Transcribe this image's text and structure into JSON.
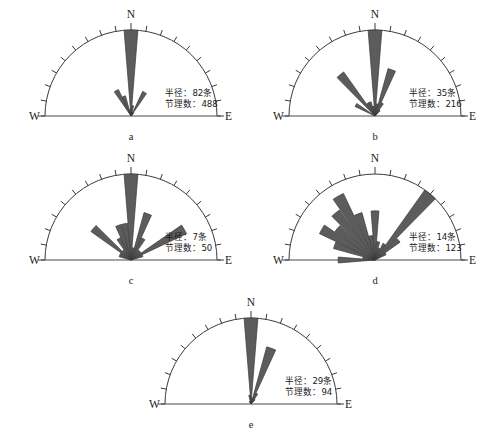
{
  "figure": {
    "type": "rose-diagram-set",
    "background": "#ffffff",
    "petal_fill": "#5c5c5c",
    "petal_stroke": "#3a3a3a",
    "axis_color": "#4a4a4a",
    "labels": {
      "north": "N",
      "west": "W",
      "east": "E",
      "radius_prefix": "半径：",
      "radius_suffix": "条",
      "count_prefix": "节理数：",
      "tick_interval_deg": 10
    }
  },
  "chart_data": {
    "type": "rose",
    "title": "",
    "xlabel": "",
    "ylabel": "",
    "angle_range_deg": [
      -90,
      90
    ],
    "angle_bin_deg": 10,
    "grid": false,
    "legend": null,
    "panels": [
      {
        "id": "a",
        "letter": "a",
        "radius_label": "半径：82条",
        "count_label": "节理数：488",
        "radius_value": 82,
        "count_value": 488,
        "north_label": "N",
        "west_label": "W",
        "east_label": "E",
        "bins_deg": [
          -90,
          -80,
          -70,
          -60,
          -50,
          -40,
          -30,
          -20,
          -10,
          0,
          10,
          20,
          30,
          40,
          50,
          60,
          70,
          80
        ],
        "values": [
          0,
          0,
          0,
          0,
          0,
          0,
          28,
          20,
          6,
          82,
          10,
          4,
          26,
          4,
          2,
          0,
          0,
          0
        ]
      },
      {
        "id": "b",
        "letter": "b",
        "radius_label": "半径：35条",
        "count_label": "节理数：216",
        "radius_value": 35,
        "count_value": 216,
        "north_label": "N",
        "west_label": "W",
        "east_label": "E",
        "bins_deg": [
          -90,
          -80,
          -70,
          -60,
          -50,
          -40,
          -30,
          -20,
          -10,
          0,
          10,
          20,
          30,
          40,
          50,
          60,
          70,
          80
        ],
        "values": [
          0,
          0,
          0,
          9,
          0,
          22,
          6,
          6,
          4,
          35,
          5,
          20,
          6,
          3,
          0,
          0,
          0,
          0
        ]
      },
      {
        "id": "c",
        "letter": "c",
        "radius_label": "半径：7条",
        "count_label": "节理数：50",
        "radius_value": 7,
        "count_value": 50,
        "north_label": "N",
        "west_label": "W",
        "east_label": "E",
        "bins_deg": [
          -90,
          -80,
          -70,
          -60,
          -50,
          -40,
          -30,
          -20,
          -10,
          0,
          10,
          20,
          30,
          40,
          50,
          60,
          70,
          80
        ],
        "values": [
          0,
          0,
          1,
          1,
          4,
          1,
          2,
          3,
          3,
          7,
          1,
          4,
          2,
          1,
          1,
          5,
          1,
          0
        ]
      },
      {
        "id": "d",
        "letter": "d",
        "radius_label": "半径：14条",
        "count_label": "节理数：123",
        "radius_value": 14,
        "count_value": 123,
        "north_label": "N",
        "west_label": "W",
        "east_label": "E",
        "bins_deg": [
          -90,
          -80,
          -70,
          -60,
          -50,
          -40,
          -30,
          -20,
          -10,
          0,
          10,
          20,
          30,
          40,
          50,
          60,
          70,
          80
        ],
        "values": [
          6,
          2,
          7,
          10,
          8,
          10,
          12,
          8,
          4,
          8,
          3,
          2,
          3,
          14,
          5,
          2,
          0,
          0
        ]
      },
      {
        "id": "e",
        "letter": "e",
        "radius_label": "半径：29条",
        "count_label": "节理数：94",
        "radius_value": 29,
        "count_value": 94,
        "north_label": "N",
        "west_label": "W",
        "east_label": "E",
        "bins_deg": [
          -90,
          -80,
          -70,
          -60,
          -50,
          -40,
          -30,
          -20,
          -10,
          0,
          10,
          20,
          30,
          40,
          50,
          60,
          70,
          80
        ],
        "values": [
          0,
          0,
          0,
          0,
          0,
          0,
          1,
          1,
          3,
          29,
          2,
          20,
          4,
          2,
          0,
          0,
          0,
          0
        ]
      }
    ]
  },
  "panel_geometry": [
    {
      "id": "a",
      "left": 18,
      "top": 8,
      "width": 230,
      "height": 140,
      "cx": 113,
      "cy": 108,
      "r": 86
    },
    {
      "id": "b",
      "left": 262,
      "top": 8,
      "width": 230,
      "height": 140,
      "cx": 113,
      "cy": 108,
      "r": 86
    },
    {
      "id": "c",
      "left": 18,
      "top": 152,
      "width": 230,
      "height": 140,
      "cx": 113,
      "cy": 108,
      "r": 86
    },
    {
      "id": "d",
      "left": 262,
      "top": 152,
      "width": 230,
      "height": 140,
      "cx": 113,
      "cy": 108,
      "r": 86
    },
    {
      "id": "e",
      "left": 138,
      "top": 296,
      "width": 230,
      "height": 140,
      "cx": 113,
      "cy": 108,
      "r": 86
    }
  ]
}
